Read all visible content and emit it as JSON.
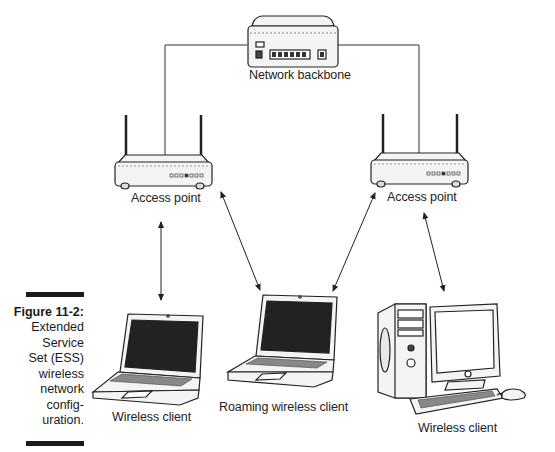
{
  "figure": {
    "number": "Figure 11-2:",
    "caption_lines": [
      "Extended",
      "Service",
      "Set (ESS)",
      "wireless",
      "network",
      "config-",
      "uration."
    ]
  },
  "nodes": {
    "backbone": {
      "label": "Network backbone",
      "icon": "network-hub-icon"
    },
    "access_point_left": {
      "label": "Access point",
      "icon": "wireless-router-icon"
    },
    "access_point_right": {
      "label": "Access point",
      "icon": "wireless-router-icon"
    },
    "client_left": {
      "label": "Wireless client",
      "icon": "laptop-icon"
    },
    "client_roaming": {
      "label": "Roaming wireless client",
      "icon": "laptop-icon"
    },
    "client_right": {
      "label": "Wireless client",
      "icon": "desktop-computer-icon"
    }
  },
  "connections": [
    {
      "from": "backbone",
      "to": "access_point_left",
      "type": "wired"
    },
    {
      "from": "backbone",
      "to": "access_point_right",
      "type": "wired"
    },
    {
      "from": "access_point_left",
      "to": "client_left",
      "type": "wireless-bidirectional"
    },
    {
      "from": "access_point_left",
      "to": "client_roaming",
      "type": "wireless-bidirectional"
    },
    {
      "from": "access_point_right",
      "to": "client_roaming",
      "type": "wireless-bidirectional"
    },
    {
      "from": "access_point_right",
      "to": "client_right",
      "type": "wireless-bidirectional"
    }
  ],
  "colors": {
    "line": "#333333",
    "device_fill": "#f2f2f2",
    "screen": "#1e1e1e",
    "caption_bar": "#1a1a1a"
  }
}
